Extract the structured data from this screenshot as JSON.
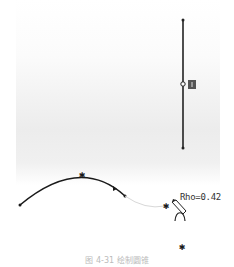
{
  "canvas": {
    "vertical_line": {
      "x": 183,
      "y_top": 20,
      "y_bottom": 148,
      "midpoint_y": 85
    },
    "constraint_badge": {
      "symbol": "vertical-constraint"
    },
    "arc": {
      "start": [
        20,
        205
      ],
      "peak": [
        82,
        174
      ],
      "end": [
        125,
        196
      ]
    },
    "preview_arc": {
      "start": [
        125,
        196
      ],
      "end": [
        165,
        206
      ]
    }
  },
  "cursor": {
    "label": "Rho=0.42",
    "icon": "conic-pencil-cursor"
  },
  "points": [
    {
      "name": "cursor-point",
      "x": 166,
      "y": 205
    },
    {
      "name": "end-point",
      "x": 182,
      "y": 247
    }
  ],
  "caption": "图 4-31  绘制圆锥"
}
